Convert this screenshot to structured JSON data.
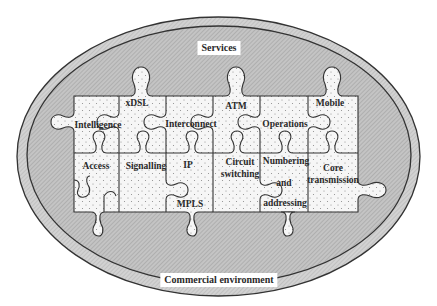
{
  "diagram": {
    "outer_label": "Commercial environment",
    "inner_label": "Services",
    "colors": {
      "outer_ring": "#c8c8c8",
      "inner_fill": "#b9b9b9",
      "piece_fill": "#f4f4f4",
      "outline": "#333333"
    },
    "pieces": [
      {
        "id": "intelligence",
        "label": "Intelligence",
        "row": 0,
        "col": 0
      },
      {
        "id": "xdsl",
        "label": "xDSL",
        "row": 0,
        "col": 1
      },
      {
        "id": "interconnect",
        "label": "Interconnect",
        "row": 0,
        "col": 2
      },
      {
        "id": "atm",
        "label": "ATM",
        "row": 0,
        "col": 3
      },
      {
        "id": "operations",
        "label": "Operations",
        "row": 0,
        "col": 4
      },
      {
        "id": "mobile",
        "label": "Mobile",
        "row": 0,
        "col": 5
      },
      {
        "id": "access",
        "label": "Access",
        "row": 1,
        "col": 0
      },
      {
        "id": "signalling",
        "label": "Signalling",
        "row": 1,
        "col": 1
      },
      {
        "id": "ip-mpls",
        "label": "IP",
        "label2": "MPLS",
        "row": 1,
        "col": 2
      },
      {
        "id": "circuit-switching",
        "label": "Circuit",
        "label2": "switching",
        "row": 1,
        "col": 3
      },
      {
        "id": "numbering-addressing",
        "label": "Numbering",
        "label2": "and",
        "label3": "addressing",
        "row": 1,
        "col": 4
      },
      {
        "id": "core-transmission",
        "label": "Core",
        "label2": "transmission",
        "row": 1,
        "col": 5
      }
    ]
  }
}
